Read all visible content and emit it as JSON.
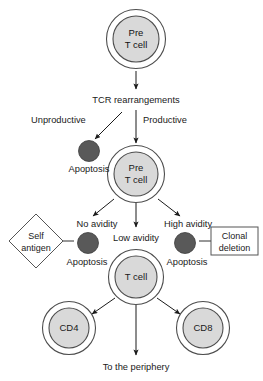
{
  "diagram": {
    "colors": {
      "cell_fill": "#d9d9d9",
      "cell_stroke": "#4d4d4d",
      "apoptosis_fill": "#595959",
      "apoptosis_stroke": "#3d3d3d",
      "outline": "#555555",
      "arrow": "#1a1a1a",
      "text": "#1a1a1a",
      "background": "#ffffff"
    },
    "cells": [
      {
        "id": "pre-t-cell-top",
        "line1": "Pre",
        "line2": "T cell",
        "cx": 136,
        "cy": 39
      },
      {
        "id": "pre-t-cell-middle",
        "line1": "Pre",
        "line2": "T cell",
        "cx": 136,
        "cy": 174
      },
      {
        "id": "t-cell",
        "line1": "T cell",
        "line2": "",
        "cx": 136,
        "cy": 277
      },
      {
        "id": "cd4-cell",
        "line1": "CD4",
        "line2": "",
        "cx": 69,
        "cy": 328
      },
      {
        "id": "cd8-cell",
        "line1": "CD8",
        "line2": "",
        "cx": 203,
        "cy": 328
      }
    ],
    "apoptosis_cells": [
      {
        "id": "apoptosis-unproductive",
        "cx": 89,
        "cy": 151
      },
      {
        "id": "apoptosis-no-avidity",
        "cx": 88,
        "cy": 243
      },
      {
        "id": "apoptosis-high-avidity",
        "cx": 185,
        "cy": 243
      }
    ],
    "labels": {
      "tcr_rearrangements": "TCR rearrangements",
      "unproductive": "Unproductive",
      "productive": "Productive",
      "apoptosis_1": "Apoptosis",
      "apoptosis_2": "Apoptosis",
      "apoptosis_3": "Apoptosis",
      "no_avidity": "No avidity",
      "low_avidity": "Low avidity",
      "high_avidity": "High avidity",
      "self_antigen_line1": "Self",
      "self_antigen_line2": "antigen",
      "clonal_deletion_line1": "Clonal",
      "clonal_deletion_line2": "deletion",
      "to_the_periphery": "To the periphery"
    },
    "shapes": {
      "self_antigen_diamond": {
        "cx": 36,
        "cy": 241,
        "rx": 27,
        "ry": 27
      },
      "clonal_deletion_box": {
        "x": 211,
        "y": 227,
        "w": 47,
        "h": 28
      }
    }
  }
}
